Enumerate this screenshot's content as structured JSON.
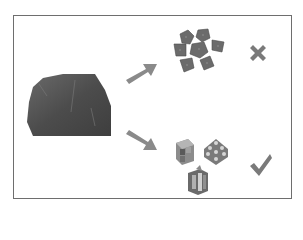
{
  "diagram": {
    "source": {
      "label": "",
      "icon": "rock-icon"
    },
    "branches": [
      {
        "direction": "up-right",
        "result_icon": "irregular-fragments-icon",
        "verdict_icon": "cross-icon",
        "verdict": "incorrect"
      },
      {
        "direction": "down-right",
        "result_icon": "interlocking-blocks-icon",
        "verdict_icon": "check-icon",
        "verdict": "correct"
      }
    ],
    "colors": {
      "border": "#6e6e6e",
      "arrow": "#8a8a8a",
      "rock": "#555555",
      "mark": "#7a7a7a"
    }
  }
}
